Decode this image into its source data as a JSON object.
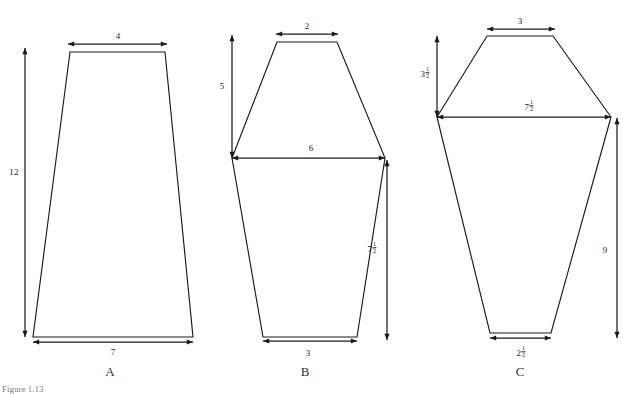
{
  "page": {
    "caption": "Figure 1.13",
    "background": "#ffffff",
    "ink_color": "#1a1a1a"
  },
  "figures": [
    {
      "id": "A",
      "label": "A",
      "label_x": 110,
      "label_y": 372,
      "shape": "trapezoid",
      "outline": "70,52 165,52 193,337 33,337",
      "dimensions": [
        {
          "name": "top-width",
          "value": "4",
          "whole": "4",
          "fraction": "",
          "orientation": "horizontal",
          "text_x": 118,
          "text_y": 36,
          "x1": 68,
          "y1": 44,
          "x2": 167,
          "y2": 44
        },
        {
          "name": "bottom-width",
          "value": "7",
          "whole": "7",
          "fraction": "",
          "orientation": "horizontal",
          "text_x": 113,
          "text_y": 352,
          "x1": 33,
          "y1": 342,
          "x2": 193,
          "y2": 342
        },
        {
          "name": "height",
          "value": "12",
          "whole": "12",
          "fraction": "",
          "orientation": "vertical",
          "text_x": 14,
          "text_y": 172,
          "x1": 25,
          "y1": 48,
          "x2": 25,
          "y2": 337
        }
      ]
    },
    {
      "id": "B",
      "label": "B",
      "label_x": 305,
      "label_y": 372,
      "shape": "hexagon",
      "outline": "277,42 337,42 385,158 357,337 263,337 232,158",
      "dimensions": [
        {
          "name": "top-width",
          "value": "2",
          "whole": "2",
          "fraction": "",
          "orientation": "horizontal",
          "text_x": 307,
          "text_y": 26,
          "x1": 276,
          "y1": 34,
          "x2": 338,
          "y2": 34
        },
        {
          "name": "middle-width",
          "value": "6",
          "whole": "6",
          "fraction": "",
          "orientation": "horizontal",
          "text_x": 311,
          "text_y": 148,
          "x1": 232,
          "y1": 158,
          "x2": 385,
          "y2": 158
        },
        {
          "name": "bottom-width",
          "value": "3",
          "whole": "3",
          "fraction": "",
          "orientation": "horizontal",
          "text_x": 308,
          "text_y": 353,
          "x1": 263,
          "y1": 341,
          "x2": 357,
          "y2": 341
        },
        {
          "name": "upper-height",
          "value": "5",
          "whole": "5",
          "fraction": "",
          "orientation": "vertical",
          "text_x": 222,
          "text_y": 86,
          "x1": 232,
          "y1": 35,
          "x2": 232,
          "y2": 158
        },
        {
          "name": "lower-right-side",
          "value": "7 1/2",
          "whole": "7",
          "fraction": "1/2",
          "orientation": "vertical",
          "text_x": 372,
          "text_y": 248,
          "x1": 387,
          "y1": 160,
          "x2": 387,
          "y2": 340
        }
      ]
    },
    {
      "id": "C",
      "label": "C",
      "label_x": 520,
      "label_y": 372,
      "shape": "hexagon",
      "outline": "487,36 553,36 611,117 551,333 490,333 437,117",
      "dimensions": [
        {
          "name": "top-width",
          "value": "3",
          "whole": "3",
          "fraction": "",
          "orientation": "horizontal",
          "text_x": 520,
          "text_y": 21,
          "x1": 487,
          "y1": 29,
          "x2": 555,
          "y2": 29
        },
        {
          "name": "middle-width",
          "value": "7 1/2",
          "whole": "7",
          "fraction": "1/2",
          "orientation": "horizontal",
          "text_x": 529,
          "text_y": 106,
          "x1": 437,
          "y1": 117,
          "x2": 611,
          "y2": 117
        },
        {
          "name": "bottom-width",
          "value": "2 1/2",
          "whole": "2",
          "fraction": "1/2",
          "orientation": "horizontal",
          "text_x": 521,
          "text_y": 352,
          "x1": 490,
          "y1": 338,
          "x2": 551,
          "y2": 338
        },
        {
          "name": "upper-height",
          "value": "3 1/2",
          "whole": "3",
          "fraction": "1/2",
          "orientation": "vertical",
          "text_x": 425,
          "text_y": 73,
          "x1": 437,
          "y1": 36,
          "x2": 437,
          "y2": 117
        },
        {
          "name": "right-height",
          "value": "9",
          "whole": "9",
          "fraction": "",
          "orientation": "vertical",
          "text_x": 605,
          "text_y": 250,
          "x1": 617,
          "y1": 118,
          "x2": 617,
          "y2": 338
        }
      ]
    }
  ]
}
